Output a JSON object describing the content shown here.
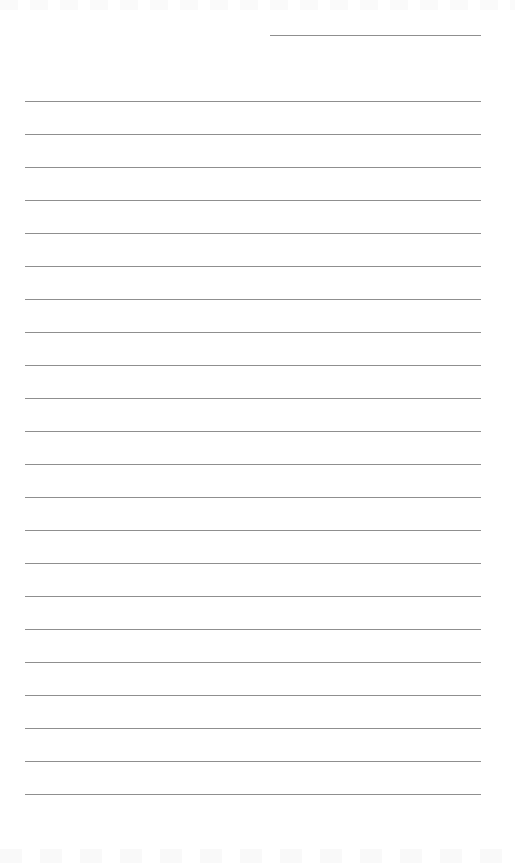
{
  "page": {
    "type": "lined-paper",
    "background_color": "#ffffff",
    "line_color": "#8f8f8f",
    "header_line": {
      "x": 270,
      "y": 35,
      "width": 211
    },
    "rules": {
      "count": 22,
      "first_y": 101,
      "spacing": 33,
      "x": 25,
      "width": 456
    }
  }
}
